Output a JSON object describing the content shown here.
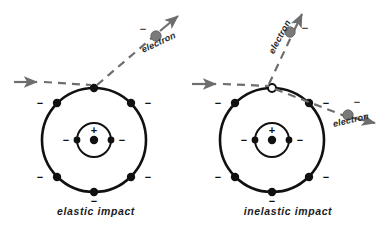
{
  "figure": {
    "colors": {
      "stroke_dark": "#111111",
      "trajectory_gray": "#6e6e6e",
      "particle_gray": "#7a7a7a",
      "background": "#ffffff"
    }
  },
  "panels": [
    {
      "id": "elastic",
      "caption": "elastic impact",
      "atom": {
        "nucleus_charge": "+",
        "inner_shell_electron_signs": [
          "−",
          "−"
        ],
        "outer_shell_electron_signs": [
          "−",
          "−",
          "−",
          "−",
          "−",
          "−",
          "−"
        ],
        "inner_shell_electron_count": 2,
        "outer_shell_electron_count": 7,
        "impact_point_style": "filled"
      },
      "particles": [
        {
          "id": "incoming",
          "label": "",
          "charge_sign": "",
          "direction": "rightward",
          "shows_marker": false
        },
        {
          "id": "scattered",
          "label": "electron",
          "charge_sign": "−",
          "direction": "up-right",
          "shows_marker": true
        }
      ]
    },
    {
      "id": "inelastic",
      "caption": "inelastic impact",
      "atom": {
        "nucleus_charge": "+",
        "inner_shell_electron_signs": [
          "−",
          "−"
        ],
        "outer_shell_electron_signs": [
          "−",
          "−",
          "−",
          "−",
          "−",
          "−"
        ],
        "inner_shell_electron_count": 2,
        "outer_shell_electron_count": 6,
        "impact_point_style": "hollow"
      },
      "particles": [
        {
          "id": "incoming",
          "label": "",
          "charge_sign": "",
          "direction": "rightward",
          "shows_marker": false
        },
        {
          "id": "ejected",
          "label": "electron",
          "charge_sign": "−",
          "direction": "up",
          "shows_marker": true
        },
        {
          "id": "scattered",
          "label": "electron",
          "charge_sign": "−",
          "direction": "right-down",
          "shows_marker": true
        }
      ]
    }
  ]
}
